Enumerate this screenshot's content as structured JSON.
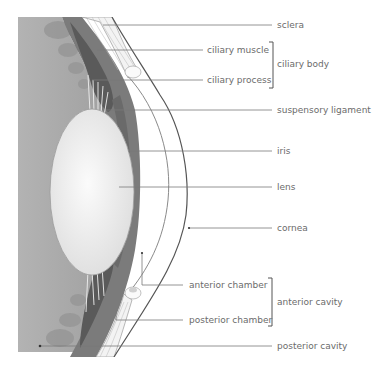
{
  "diagram": {
    "labels": {
      "sclera": "sclera",
      "ciliary_muscle": "ciliary muscle",
      "ciliary_process": "ciliary process",
      "ciliary_body": "ciliary body",
      "suspensory_ligament": "suspensory ligament",
      "iris": "iris",
      "lens": "lens",
      "cornea": "cornea",
      "anterior_chamber": "anterior chamber",
      "posterior_chamber": "posterior chamber",
      "anterior_cavity": "anterior cavity",
      "posterior_cavity": "posterior cavity"
    },
    "groups": [
      {
        "name": "ciliary body",
        "members": [
          "ciliary muscle",
          "ciliary process"
        ]
      },
      {
        "name": "anterior cavity",
        "members": [
          "anterior chamber",
          "posterior chamber"
        ]
      }
    ],
    "colors": {
      "vitreous": "#a9a9a9",
      "choroid": "#7d7d7d",
      "ciliary": "#5e5e5e",
      "lens": "#ededed",
      "sclera": "#f4f4f4",
      "leader": "#7a7a7a",
      "text": "#6b6b6b"
    }
  }
}
